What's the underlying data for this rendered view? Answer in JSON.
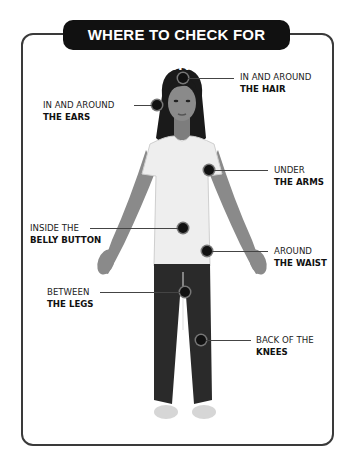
{
  "title": "WHERE TO CHECK FOR TICKS",
  "colors": {
    "frame": "#3a3a3a",
    "title_background": "#111111",
    "title_text": "#ffffff",
    "marker": "#111111",
    "hair": "#1a1a1a",
    "skin": "#8a8a8a",
    "shirt": "#eeeeee",
    "pants": "#2a2a2a"
  },
  "labels": [
    {
      "id": "hair",
      "line1": "IN AND AROUND",
      "line2": "THE HAIR",
      "side": "right"
    },
    {
      "id": "ears",
      "line1": "IN AND AROUND",
      "line2": "THE EARS",
      "side": "left"
    },
    {
      "id": "arms",
      "line1": "UNDER",
      "line2": "THE ARMS",
      "side": "right"
    },
    {
      "id": "belly",
      "line1": "INSIDE THE",
      "line2": "BELLY BUTTON",
      "side": "left"
    },
    {
      "id": "waist",
      "line1": "AROUND",
      "line2": "THE WAIST",
      "side": "right"
    },
    {
      "id": "legs",
      "line1": "BETWEEN",
      "line2": "THE LEGS",
      "side": "left"
    },
    {
      "id": "knees",
      "line1": "BACK OF THE",
      "line2": "KNEES",
      "side": "right"
    }
  ]
}
